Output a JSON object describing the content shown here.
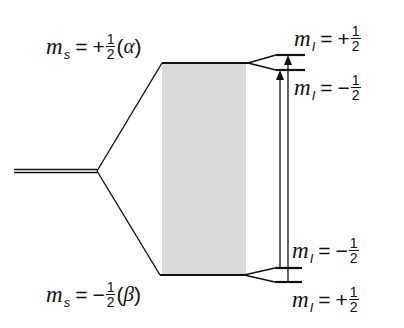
{
  "diagram": {
    "type": "energy-level diagram (electron spin Zeeman + hyperfine splitting)",
    "upper_state": {
      "symbol": "m",
      "subscript": "s",
      "sign": "+",
      "numerator": "1",
      "denominator": "2",
      "spin_label": "α"
    },
    "lower_state": {
      "symbol": "m",
      "subscript": "s",
      "sign": "−",
      "numerator": "1",
      "denominator": "2",
      "spin_label": "β"
    },
    "upper_sublevels": [
      {
        "symbol": "m",
        "subscript": "I",
        "sign": "+",
        "numerator": "1",
        "denominator": "2"
      },
      {
        "symbol": "m",
        "subscript": "I",
        "sign": "−",
        "numerator": "1",
        "denominator": "2"
      }
    ],
    "lower_sublevels": [
      {
        "symbol": "m",
        "subscript": "I",
        "sign": "−",
        "numerator": "1",
        "denominator": "2"
      },
      {
        "symbol": "m",
        "subscript": "I",
        "sign": "+",
        "numerator": "1",
        "denominator": "2"
      }
    ],
    "transitions": 2,
    "colors": {
      "line": "#111111",
      "shade": "#d9d9d9"
    }
  }
}
